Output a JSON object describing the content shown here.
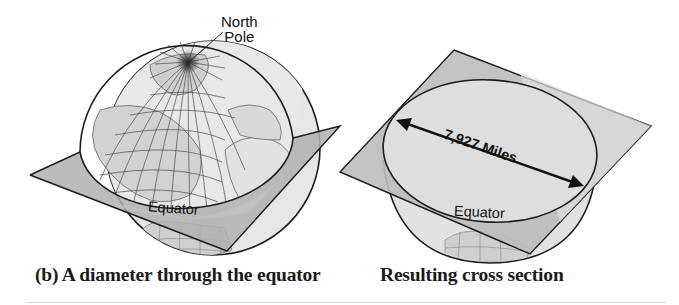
{
  "figure": {
    "left_panel": {
      "caption": "(b) A diameter through the equator",
      "callout": {
        "line1": "North",
        "line2": "Pole"
      },
      "equator_label": "Equator"
    },
    "right_panel": {
      "caption": "Resulting cross section",
      "diameter_label": "7,927 Miles",
      "equator_label": "Equator"
    }
  },
  "colors": {
    "globe_fill": "#e4e4e4",
    "plane_dark": "#a9a9a9",
    "plane_light": "#d2d2d2",
    "cross_section": "#dcdcdc",
    "land": "#cfcfcf",
    "outline": "#1c1c1c",
    "grid": "#555555"
  }
}
